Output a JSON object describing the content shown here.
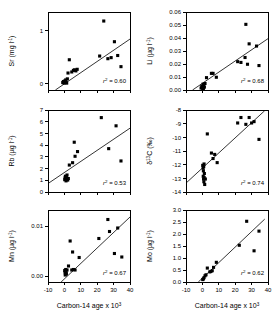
{
  "figure": {
    "type": "scatter-panel-grid",
    "rows": 3,
    "cols": 2,
    "background": "#ffffff",
    "marker_color": "#000000",
    "line_color": "#000000"
  },
  "axis": {
    "x_title": "Carbon-14 age x 10",
    "x_title_exp": "3",
    "x_ticks": [
      "-10",
      "0",
      "10",
      "20",
      "30",
      "40"
    ],
    "x_min": -10,
    "x_max": 40
  },
  "chart_data": [
    {
      "id": "sr",
      "type": "scatter",
      "title": "",
      "ylabel": "Sr (mg l",
      "ylabel_exp": "-1",
      "ylabel_tail": ")",
      "xlabel": "Carbon-14 age x 10^3",
      "xlim": [
        -10,
        40
      ],
      "ylim": [
        -0.12,
        1.35
      ],
      "y_ticks": [
        "0",
        "1"
      ],
      "y_tick_values": [
        0,
        1
      ],
      "grid": false,
      "annotation": "r",
      "annotation_exp": "2",
      "annotation_value": " = 0.60",
      "r2": 0.6,
      "fit": {
        "x0": -5.5,
        "y0": -0.12,
        "x1": 40,
        "y1": 0.84
      },
      "points": [
        {
          "x": -1.0,
          "y": 0.02
        },
        {
          "x": -0.6,
          "y": 0.04
        },
        {
          "x": -0.2,
          "y": 0.01
        },
        {
          "x": 0.2,
          "y": 0.05
        },
        {
          "x": 0.4,
          "y": 0.02
        },
        {
          "x": 0.8,
          "y": 0.07
        },
        {
          "x": 1.0,
          "y": 0.03
        },
        {
          "x": 1.4,
          "y": 0.01
        },
        {
          "x": 1.8,
          "y": 0.09
        },
        {
          "x": 2.2,
          "y": 0.2
        },
        {
          "x": 3.0,
          "y": 0.45
        },
        {
          "x": 4.5,
          "y": 0.22
        },
        {
          "x": 5.5,
          "y": 0.25
        },
        {
          "x": 6.2,
          "y": 0.26
        },
        {
          "x": 7.0,
          "y": 0.24
        },
        {
          "x": 7.8,
          "y": 0.27
        },
        {
          "x": 21.5,
          "y": 0.52
        },
        {
          "x": 24.0,
          "y": 1.18
        },
        {
          "x": 26.5,
          "y": 0.47
        },
        {
          "x": 28.5,
          "y": 0.49
        },
        {
          "x": 30.5,
          "y": 0.79
        },
        {
          "x": 32.5,
          "y": 0.53
        },
        {
          "x": 34.5,
          "y": 0.32
        }
      ]
    },
    {
      "id": "li",
      "type": "scatter",
      "title": "",
      "ylabel": "Li (µg l",
      "ylabel_exp": "-1",
      "ylabel_tail": ")",
      "xlabel": "Carbon-14 age x 10^3",
      "xlim": [
        -10,
        40
      ],
      "ylim": [
        0.0,
        0.06
      ],
      "y_ticks": [
        "0.00",
        "0.01",
        "0.02",
        "0.03",
        "0.04",
        "0.05",
        "0.06"
      ],
      "y_tick_values": [
        0.0,
        0.01,
        0.02,
        0.03,
        0.04,
        0.05,
        0.06
      ],
      "grid": false,
      "annotation": "r",
      "annotation_exp": "2",
      "annotation_value": " = 0.68",
      "r2": 0.68,
      "fit": {
        "x0": -6.0,
        "y0": 0.0,
        "x1": 40,
        "y1": 0.0395
      },
      "points": [
        {
          "x": -0.8,
          "y": 0.0015
        },
        {
          "x": -0.4,
          "y": 0.003
        },
        {
          "x": 0.0,
          "y": 0.002
        },
        {
          "x": 0.4,
          "y": 0.0045
        },
        {
          "x": 0.8,
          "y": 0.0035
        },
        {
          "x": 1.2,
          "y": 0.0022
        },
        {
          "x": 1.6,
          "y": 0.005
        },
        {
          "x": 0.2,
          "y": 0.0008
        },
        {
          "x": 0.6,
          "y": 0.0012
        },
        {
          "x": 2.5,
          "y": 0.0095
        },
        {
          "x": 5.5,
          "y": 0.0128
        },
        {
          "x": 6.5,
          "y": 0.0128
        },
        {
          "x": 8.5,
          "y": 0.0098
        },
        {
          "x": 21.5,
          "y": 0.0218
        },
        {
          "x": 23.5,
          "y": 0.0212
        },
        {
          "x": 26.0,
          "y": 0.025
        },
        {
          "x": 26.5,
          "y": 0.0505
        },
        {
          "x": 27.5,
          "y": 0.0198
        },
        {
          "x": 28.5,
          "y": 0.0355
        },
        {
          "x": 33.0,
          "y": 0.0338
        },
        {
          "x": 34.5,
          "y": 0.0188
        }
      ]
    },
    {
      "id": "rb",
      "type": "scatter",
      "title": "",
      "ylabel": "Rb (µg l",
      "ylabel_exp": "-1",
      "ylabel_tail": ")",
      "xlabel": "Carbon-14 age x 10^3",
      "xlim": [
        -10,
        40
      ],
      "ylim": [
        0,
        7
      ],
      "y_ticks": [
        "0",
        "1",
        "2",
        "3",
        "4",
        "5",
        "6",
        "7"
      ],
      "y_tick_values": [
        0,
        1,
        2,
        3,
        4,
        5,
        6,
        7
      ],
      "grid": false,
      "annotation": "r",
      "annotation_exp": "2",
      "annotation_value": " = 0.53",
      "r2": 0.53,
      "fit": {
        "x0": -10,
        "y0": 0.72,
        "x1": 40,
        "y1": 5.45
      },
      "points": [
        {
          "x": 0.2,
          "y": 1.05
        },
        {
          "x": 0.4,
          "y": 1.2
        },
        {
          "x": 0.6,
          "y": 1.35
        },
        {
          "x": 0.8,
          "y": 1.1
        },
        {
          "x": 1.0,
          "y": 0.95
        },
        {
          "x": 1.2,
          "y": 1.25
        },
        {
          "x": 1.6,
          "y": 1.45
        },
        {
          "x": 2.0,
          "y": 1.02
        },
        {
          "x": 2.4,
          "y": 1.15
        },
        {
          "x": 3.0,
          "y": 2.3
        },
        {
          "x": 5.0,
          "y": 2.5
        },
        {
          "x": 6.0,
          "y": 4.25
        },
        {
          "x": 6.5,
          "y": 3.05
        },
        {
          "x": 8.0,
          "y": 3.45
        },
        {
          "x": 22.5,
          "y": 6.35
        },
        {
          "x": 27.0,
          "y": 3.7
        },
        {
          "x": 31.5,
          "y": 5.65
        },
        {
          "x": 34.5,
          "y": 2.65
        }
      ]
    },
    {
      "id": "d13c",
      "type": "scatter",
      "title": "",
      "ylabel": "δ",
      "ylabel_exp": "13",
      "ylabel_tail": "C (‰)",
      "xlabel": "Carbon-14 age x 10^3",
      "xlim": [
        -10,
        40
      ],
      "ylim": [
        -14,
        -8
      ],
      "y_ticks": [
        "-8",
        "-9",
        "-10",
        "-11",
        "-12",
        "-13",
        "-14"
      ],
      "y_tick_values": [
        -8,
        -9,
        -10,
        -11,
        -12,
        -13,
        -14
      ],
      "grid": false,
      "annotation": "r",
      "annotation_exp": "2",
      "annotation_value": " = 0.74",
      "r2": 0.74,
      "fit": {
        "x0": -10,
        "y0": -13.35,
        "x1": 38,
        "y1": -8.05
      },
      "points": [
        {
          "x": 0.2,
          "y": -12.05
        },
        {
          "x": 0.4,
          "y": -12.25
        },
        {
          "x": 0.6,
          "y": -12.45
        },
        {
          "x": 0.8,
          "y": -12.15
        },
        {
          "x": 1.0,
          "y": -11.95
        },
        {
          "x": 1.2,
          "y": -12.65
        },
        {
          "x": 0.5,
          "y": -12.85
        },
        {
          "x": 0.7,
          "y": -13.05
        },
        {
          "x": 0.9,
          "y": -13.25
        },
        {
          "x": 1.1,
          "y": -12.95
        },
        {
          "x": 1.4,
          "y": -13.45
        },
        {
          "x": 1.8,
          "y": -13.05
        },
        {
          "x": 3.0,
          "y": -9.75
        },
        {
          "x": 5.5,
          "y": -11.15
        },
        {
          "x": 6.5,
          "y": -11.55
        },
        {
          "x": 7.5,
          "y": -11.25
        },
        {
          "x": 9.0,
          "y": -11.85
        },
        {
          "x": 21.5,
          "y": -8.95
        },
        {
          "x": 23.5,
          "y": -8.55
        },
        {
          "x": 26.5,
          "y": -9.05
        },
        {
          "x": 28.5,
          "y": -8.55
        },
        {
          "x": 30.0,
          "y": -8.95
        },
        {
          "x": 31.5,
          "y": -8.85
        },
        {
          "x": 34.5,
          "y": -10.15
        }
      ]
    },
    {
      "id": "mn",
      "type": "scatter",
      "title": "",
      "ylabel": "Mn (µg l",
      "ylabel_exp": "-1",
      "ylabel_tail": ")",
      "xlabel": "Carbon-14 age x 10^3",
      "xlim": [
        -10,
        40
      ],
      "ylim": [
        -0.0012,
        0.0132
      ],
      "y_ticks": [
        "0.00",
        "0.01"
      ],
      "y_tick_values": [
        0.0,
        0.01
      ],
      "grid": false,
      "annotation": "r",
      "annotation_exp": "2",
      "annotation_value": " = 0.67",
      "r2": 0.67,
      "fit": {
        "x0": -2.0,
        "y0": -0.0012,
        "x1": 40,
        "y1": 0.0118
      },
      "points": [
        {
          "x": 0.2,
          "y": 0.0011
        },
        {
          "x": 0.4,
          "y": 0.0008
        },
        {
          "x": 0.6,
          "y": 0.0005
        },
        {
          "x": 0.8,
          "y": 0.0013
        },
        {
          "x": 1.0,
          "y": 0.0009
        },
        {
          "x": 1.2,
          "y": 0.0004
        },
        {
          "x": 0.5,
          "y": 0.0002
        },
        {
          "x": 0.9,
          "y": 0.0006
        },
        {
          "x": 1.6,
          "y": 0.0012
        },
        {
          "x": 2.5,
          "y": 0.002
        },
        {
          "x": 3.5,
          "y": 0.007
        },
        {
          "x": 4.5,
          "y": 0.0012
        },
        {
          "x": 5.5,
          "y": 0.0013
        },
        {
          "x": 6.5,
          "y": 0.0012
        },
        {
          "x": 5.0,
          "y": 0.0048
        },
        {
          "x": 9.0,
          "y": 0.0037
        },
        {
          "x": 21.0,
          "y": 0.0075
        },
        {
          "x": 26.5,
          "y": 0.0113
        },
        {
          "x": 27.5,
          "y": 0.0089
        },
        {
          "x": 30.5,
          "y": 0.0045
        },
        {
          "x": 32.5,
          "y": 0.0096
        },
        {
          "x": 35.0,
          "y": 0.0038
        }
      ]
    },
    {
      "id": "mo",
      "type": "scatter",
      "title": "",
      "ylabel": "Mo (µg l",
      "ylabel_exp": "-1",
      "ylabel_tail": ")",
      "xlabel": "Carbon-14 age x 10^3",
      "xlim": [
        -10,
        40
      ],
      "ylim": [
        0.0,
        3.0
      ],
      "y_ticks": [
        "0.0",
        "0.5",
        "1.0",
        "1.5",
        "2.0",
        "2.5",
        "3.0"
      ],
      "y_tick_values": [
        0.0,
        0.5,
        1.0,
        1.5,
        2.0,
        2.5,
        3.0
      ],
      "grid": false,
      "annotation": "r",
      "annotation_exp": "2",
      "annotation_value": " = 0.62",
      "r2": 0.62,
      "fit": {
        "x0": -2.5,
        "y0": 0.0,
        "x1": 38,
        "y1": 2.62
      },
      "points": [
        {
          "x": 0.2,
          "y": 0.1
        },
        {
          "x": 0.6,
          "y": 0.13
        },
        {
          "x": 1.0,
          "y": 0.18
        },
        {
          "x": 1.6,
          "y": 0.26
        },
        {
          "x": 2.2,
          "y": 0.3
        },
        {
          "x": 3.0,
          "y": 0.58
        },
        {
          "x": 4.5,
          "y": 0.42
        },
        {
          "x": 5.2,
          "y": 0.44
        },
        {
          "x": 6.0,
          "y": 0.47
        },
        {
          "x": 6.8,
          "y": 0.61
        },
        {
          "x": 8.5,
          "y": 0.82
        },
        {
          "x": 22.5,
          "y": 1.53
        },
        {
          "x": 27.0,
          "y": 2.53
        },
        {
          "x": 31.5,
          "y": 1.3
        },
        {
          "x": 34.5,
          "y": 2.12
        }
      ]
    }
  ]
}
